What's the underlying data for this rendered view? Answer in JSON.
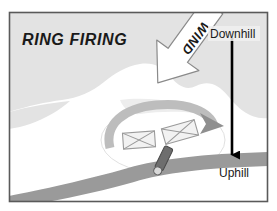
{
  "figure": {
    "title_label": "RING FIRING",
    "labels": {
      "wind": "WIND",
      "downhill": "Downhill",
      "uphill": "Uphill"
    },
    "colors": {
      "frame_border": "#5a5a5a",
      "terrain_gray": "#e3e3e3",
      "ring_arrow_gray": "#bdbdbd",
      "road_gray": "#9a9a9a",
      "arrow_black": "#000000",
      "wind_arrow_fill": "#ffffff",
      "wind_arrow_stroke": "#8a8a8a",
      "vehicle_fill": "#f2f2f2",
      "vehicle_stroke": "#9a9a9a",
      "igniter_fill": "#6e6e6e",
      "background": "#ffffff"
    },
    "elements": {
      "ring_label": "fire-ring-ellipse",
      "ring_direction_arrow": "ring-direction-arrow",
      "road": "road-band",
      "crew_symbols": [
        "crew-symbol-left",
        "crew-symbol-right"
      ],
      "igniter": "igniter-figure",
      "slope_arrow": "slope-direction-arrow"
    }
  }
}
